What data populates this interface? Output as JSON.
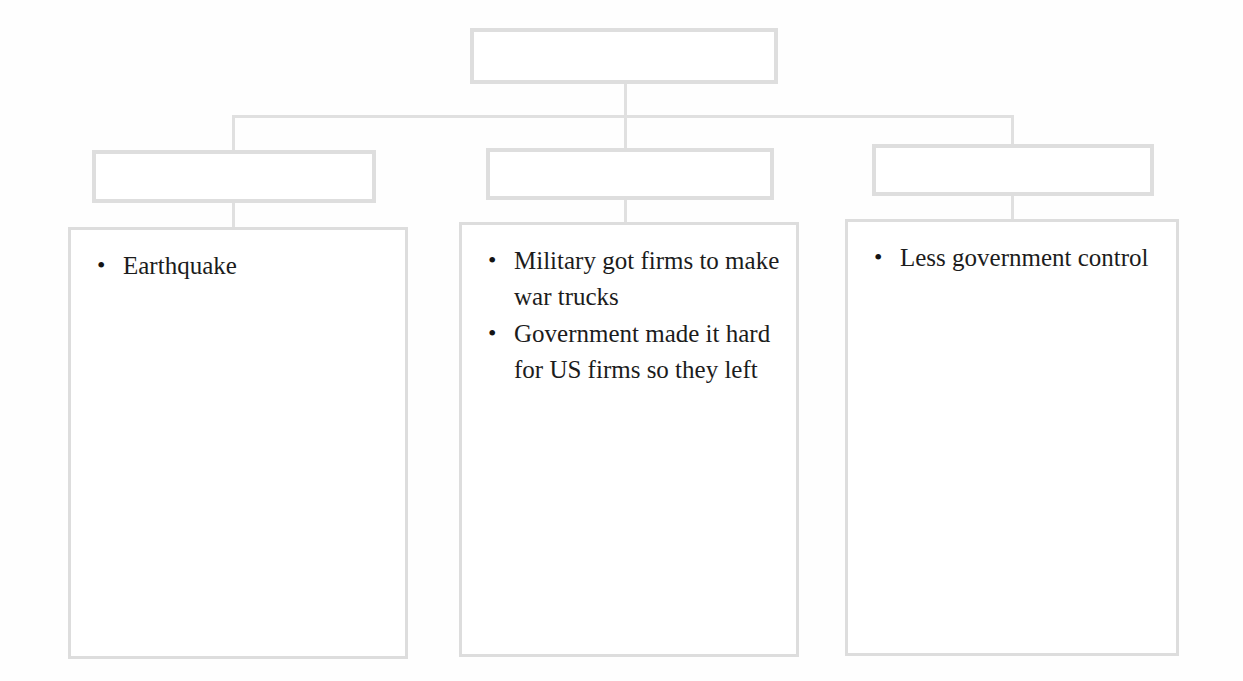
{
  "diagram": {
    "type": "hierarchy-tree",
    "orientation": "top-down",
    "levels": 3,
    "colors": {
      "border": "#dcdcdc",
      "connector": "#e0e0e0",
      "text": "#1c1c1c",
      "background": "#fefefe"
    },
    "root": {
      "label": ""
    },
    "branches": [
      {
        "header": {
          "label": ""
        },
        "body": {
          "items": [
            "Earthquake"
          ]
        }
      },
      {
        "header": {
          "label": ""
        },
        "body": {
          "items": [
            "Military got firms to make war trucks",
            "Government made it hard for US firms so they left"
          ]
        }
      },
      {
        "header": {
          "label": ""
        },
        "body": {
          "items": [
            "Less government control"
          ]
        }
      }
    ]
  }
}
